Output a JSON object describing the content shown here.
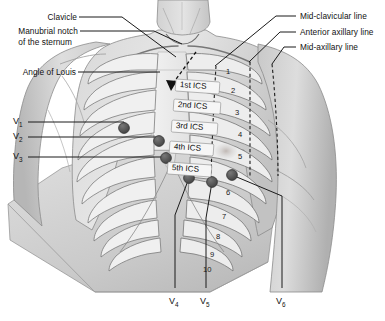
{
  "figure": {
    "type": "anatomical-diagram",
    "colors": {
      "skin_light": "#e9e9e9",
      "skin_mid": "#cfcfcf",
      "skin_dark": "#b4b4b4",
      "outline": "#6b6b6b",
      "electrode": "#5a5a5a",
      "electrode_edge": "#3a3a3a",
      "leader_line": "#1a1a1a",
      "dashed_line": "#1d1d1d",
      "text": "#121212",
      "background": "#ffffff"
    }
  },
  "labels_left": [
    {
      "id": "clavicle",
      "text": "Clavicle"
    },
    {
      "id": "manubrial-notch-line1",
      "text": "Manubrial notch"
    },
    {
      "id": "manubrial-notch-line2",
      "text": "of the sternum"
    },
    {
      "id": "angle-of-louis",
      "text": "Angle of Louis"
    }
  ],
  "labels_right": [
    {
      "id": "mid-clavicular-line",
      "text": "Mid-clavicular line"
    },
    {
      "id": "anterior-axillary-line",
      "text": "Anterior axillary line"
    },
    {
      "id": "mid-axillary-line",
      "text": "Mid-axillary line"
    }
  ],
  "intercostal_spaces": [
    {
      "id": "ics-1",
      "text": "1st ICS"
    },
    {
      "id": "ics-2",
      "text": "2nd ICS"
    },
    {
      "id": "ics-3",
      "text": "3rd ICS"
    },
    {
      "id": "ics-4",
      "text": "4th ICS"
    },
    {
      "id": "ics-5",
      "text": "5th ICS"
    }
  ],
  "rib_numbers": [
    "1",
    "2",
    "3",
    "4",
    "5",
    "6",
    "7",
    "8",
    "9",
    "10"
  ],
  "electrodes": [
    {
      "id": "V1",
      "label": "V",
      "sub": "1",
      "side": "left",
      "x": 124,
      "y": 128
    },
    {
      "id": "V2",
      "label": "V",
      "sub": "2",
      "side": "left",
      "x": 159,
      "y": 141
    },
    {
      "id": "V3",
      "label": "V",
      "sub": "3",
      "side": "left",
      "x": 166,
      "y": 158
    },
    {
      "id": "V4",
      "label": "V",
      "sub": "4",
      "side": "bottom",
      "x": 189,
      "y": 178
    },
    {
      "id": "V5",
      "label": "V",
      "sub": "5",
      "side": "bottom",
      "x": 212,
      "y": 182
    },
    {
      "id": "V6",
      "label": "V",
      "sub": "6",
      "side": "bottom",
      "x": 232,
      "y": 175
    }
  ],
  "electrode_labels_left": [
    {
      "id": "v1-label",
      "label": "V",
      "sub": "1"
    },
    {
      "id": "v2-label",
      "label": "V",
      "sub": "2"
    },
    {
      "id": "v3-label",
      "label": "V",
      "sub": "3"
    }
  ],
  "electrode_labels_bottom": [
    {
      "id": "v4-label",
      "label": "V",
      "sub": "4"
    },
    {
      "id": "v5-label",
      "label": "V",
      "sub": "5"
    },
    {
      "id": "v6-label",
      "label": "V",
      "sub": "6"
    }
  ]
}
